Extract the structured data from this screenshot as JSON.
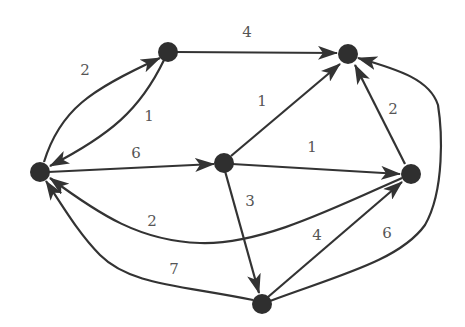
{
  "diagram": {
    "type": "weighted-directed-graph",
    "colors": {
      "node": "#2f2f2f",
      "edge": "#333333",
      "label": "#555555",
      "background": "#ffffff"
    },
    "nodes": [
      {
        "id": "A",
        "x": 168,
        "y": 52
      },
      {
        "id": "B",
        "x": 348,
        "y": 54
      },
      {
        "id": "C",
        "x": 40,
        "y": 172
      },
      {
        "id": "D",
        "x": 224,
        "y": 163
      },
      {
        "id": "E",
        "x": 411,
        "y": 174
      },
      {
        "id": "F",
        "x": 262,
        "y": 304
      }
    ],
    "edges": [
      {
        "from": "C",
        "to": "A",
        "weight": "2"
      },
      {
        "from": "A",
        "to": "C",
        "weight": "1"
      },
      {
        "from": "A",
        "to": "B",
        "weight": "4"
      },
      {
        "from": "D",
        "to": "B",
        "weight": "1"
      },
      {
        "from": "C",
        "to": "D",
        "weight": "6"
      },
      {
        "from": "D",
        "to": "E",
        "weight": "1"
      },
      {
        "from": "E",
        "to": "B",
        "weight": "2"
      },
      {
        "from": "E",
        "to": "C",
        "weight": "2"
      },
      {
        "from": "D",
        "to": "F",
        "weight": "3"
      },
      {
        "from": "F",
        "to": "E",
        "weight": "4"
      },
      {
        "from": "F",
        "to": "C",
        "weight": "7"
      },
      {
        "from": "F",
        "to": "B",
        "weight": "6"
      }
    ]
  }
}
